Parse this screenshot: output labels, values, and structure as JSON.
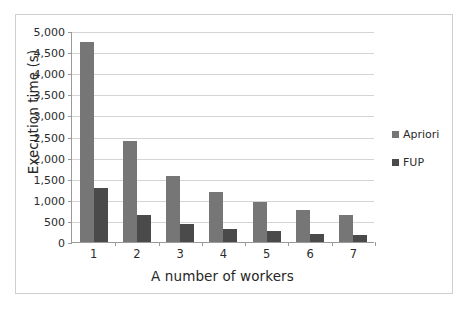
{
  "chart_data": {
    "type": "bar",
    "title": "",
    "xlabel": "A number of workers",
    "ylabel": "Execution time (s)",
    "categories": [
      "1",
      "2",
      "3",
      "4",
      "5",
      "6",
      "7"
    ],
    "ylim": [
      0,
      5000
    ],
    "ytick_labels": [
      "0",
      "500",
      "1,000",
      "1,500",
      "2,000",
      "2,500",
      "3,000",
      "3,500",
      "4,000",
      "4,500",
      "5,000"
    ],
    "ytick_values": [
      0,
      500,
      1000,
      1500,
      2000,
      2500,
      3000,
      3500,
      4000,
      4500,
      5000
    ],
    "grid": "horizontal",
    "legend_position": "right",
    "series": [
      {
        "name": "Apriori",
        "color": "#767676",
        "values": [
          4730,
          2390,
          1570,
          1180,
          945,
          770,
          650
        ]
      },
      {
        "name": "FUP",
        "color": "#4a4a4a",
        "values": [
          1270,
          640,
          420,
          310,
          250,
          200,
          165
        ]
      }
    ]
  },
  "legend": {
    "entries": [
      {
        "label": "Apriori",
        "marker": "square-swatch-icon"
      },
      {
        "label": "FUP",
        "marker": "square-swatch-icon"
      }
    ]
  }
}
